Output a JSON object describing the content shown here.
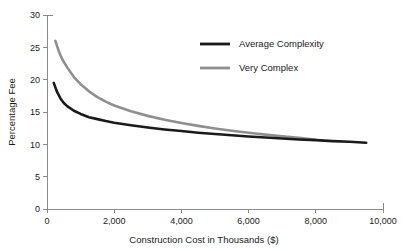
{
  "chart_data": {
    "type": "line",
    "title": "",
    "xlabel": "Construction Cost in Thousands ($)",
    "ylabel": "Percentage Fee",
    "xlim": [
      0,
      10000
    ],
    "ylim": [
      0,
      30
    ],
    "xticks": [
      0,
      2000,
      4000,
      6000,
      8000,
      10000
    ],
    "xticklabels": [
      "0",
      "2,000",
      "4,000",
      "6,000",
      "8,000",
      "10,000"
    ],
    "yticks": [
      0,
      5,
      10,
      15,
      20,
      25,
      30
    ],
    "yticklabels": [
      "0",
      "5",
      "10",
      "15",
      "20",
      "25",
      "30"
    ],
    "grid": false,
    "legend_position": "upper-center-right",
    "series": [
      {
        "name": "Average Complexity",
        "color": "#1a1a1a",
        "linewidth": 2.6,
        "x": [
          200,
          300,
          400,
          500,
          600,
          800,
          1000,
          1250,
          1500,
          1750,
          2000,
          2500,
          3000,
          3500,
          4000,
          4500,
          5000,
          5500,
          6000,
          6500,
          7000,
          7500,
          8000,
          8500,
          9000,
          9500
        ],
        "y": [
          19.5,
          18.1,
          17.1,
          16.4,
          15.9,
          15.2,
          14.7,
          14.2,
          13.9,
          13.6,
          13.35,
          12.95,
          12.6,
          12.3,
          12.05,
          11.8,
          11.6,
          11.4,
          11.2,
          11.05,
          10.9,
          10.75,
          10.65,
          10.5,
          10.4,
          10.25
        ]
      },
      {
        "name": "Very Complex",
        "color": "#8f8f8f",
        "linewidth": 2.6,
        "x": [
          250,
          350,
          450,
          600,
          800,
          1000,
          1250,
          1500,
          1750,
          2000,
          2500,
          3000,
          3500,
          4000,
          4500,
          5000,
          5500,
          6000,
          6500,
          7000,
          7500,
          8000
        ],
        "y": [
          26.0,
          24.4,
          23.2,
          21.9,
          20.4,
          19.3,
          18.2,
          17.3,
          16.6,
          16.0,
          15.1,
          14.4,
          13.8,
          13.3,
          12.85,
          12.45,
          12.1,
          11.8,
          11.5,
          11.25,
          11.0,
          10.7
        ]
      }
    ],
    "legend": [
      {
        "label": "Average Complexity",
        "color": "#1a1a1a"
      },
      {
        "label": "Very Complex",
        "color": "#8f8f8f"
      }
    ]
  }
}
